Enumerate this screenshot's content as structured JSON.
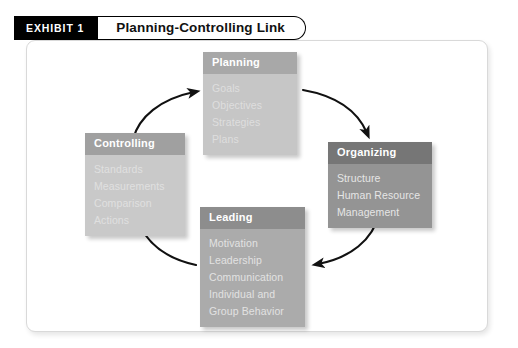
{
  "exhibit": {
    "tag_label": "EXHIBIT 1",
    "title": "Planning-Controlling Link"
  },
  "diagram": {
    "cycle_direction": "clockwise",
    "boxes": [
      {
        "id": "planning",
        "title": "Planning",
        "items": [
          "Goals",
          "Objectives",
          "Strategies",
          "Plans"
        ],
        "header_color": "#a8a8a8",
        "body_color": "#c6c6c6"
      },
      {
        "id": "organizing",
        "title": "Organizing",
        "items": [
          "Structure",
          "Human Resource\n  Management"
        ],
        "header_color": "#767676",
        "body_color": "#949494"
      },
      {
        "id": "leading",
        "title": "Leading",
        "items": [
          "Motivation",
          "Leadership",
          "Communication",
          "Individual and\n  Group Behavior"
        ],
        "header_color": "#8d8d8d",
        "body_color": "#ababab"
      },
      {
        "id": "controlling",
        "title": "Controlling",
        "items": [
          "Standards",
          "Measurements",
          "Comparison",
          "Actions"
        ],
        "header_color": "#a0a0a0",
        "body_color": "#c9c9c9"
      }
    ],
    "arrows": [
      {
        "from": "planning",
        "to": "organizing"
      },
      {
        "from": "organizing",
        "to": "leading"
      },
      {
        "from": "leading",
        "to": "controlling"
      },
      {
        "from": "controlling",
        "to": "planning"
      }
    ]
  }
}
